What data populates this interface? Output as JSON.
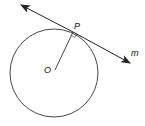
{
  "diagram": {
    "type": "geometry",
    "colors": {
      "stroke": "#222222",
      "background": "#ffffff"
    },
    "labels": {
      "center": "O",
      "tangent_point": "P",
      "tangent_line": "m"
    },
    "elements": [
      {
        "kind": "circle",
        "center": "O"
      },
      {
        "kind": "segment",
        "from": "O",
        "to": "P",
        "role": "radius"
      },
      {
        "kind": "line",
        "name": "m",
        "through": "P",
        "role": "tangent",
        "arrows": "both"
      },
      {
        "kind": "right-angle-marker",
        "at": "P"
      }
    ]
  }
}
